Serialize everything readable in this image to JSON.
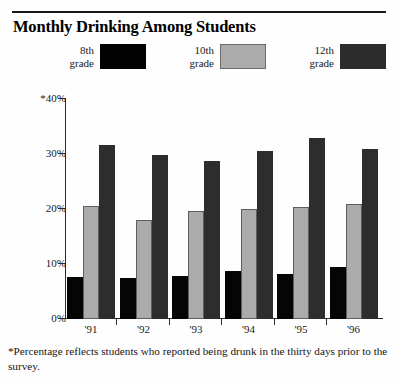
{
  "title": "Monthly Drinking Among Students",
  "footnote": "*Percentage reflects students who reported being drunk in the thirty days prior to the survey.",
  "legend": {
    "position": "top",
    "items": [
      {
        "line1": "8th",
        "line2": "grade",
        "color": "#050505",
        "series": "8th grade"
      },
      {
        "line1": "10th",
        "line2": "grade",
        "color": "#ababab",
        "series": "10th grade"
      },
      {
        "line1": "12th",
        "line2": "grade",
        "color": "#2d2d2d",
        "series": "12th grade"
      }
    ]
  },
  "yaxis": {
    "ticks": [
      "*40%",
      "30%",
      "20%",
      "10%",
      "0%"
    ]
  },
  "chart_data": {
    "type": "bar",
    "title": "Monthly Drinking Among Students",
    "xlabel": "",
    "ylabel": "",
    "ylim": [
      0,
      40
    ],
    "ytick_values": [
      0,
      10,
      20,
      30,
      40
    ],
    "ytick_labels": [
      "0%",
      "10%",
      "20%",
      "30%",
      "*40%"
    ],
    "grid": false,
    "legend_position": "top",
    "categories": [
      "'91",
      "'92",
      "'93",
      "'94",
      "'95",
      "'96"
    ],
    "series": [
      {
        "name": "8th grade",
        "color": "#050505",
        "values": [
          7.6,
          7.5,
          7.8,
          8.7,
          8.2,
          9.4
        ]
      },
      {
        "name": "10th grade",
        "color": "#ababab",
        "values": [
          20.5,
          18.0,
          19.6,
          20.0,
          20.4,
          21.0
        ]
      },
      {
        "name": "12th grade",
        "color": "#2d2d2d",
        "values": [
          31.6,
          29.8,
          28.7,
          30.6,
          33.0,
          31.0
        ]
      }
    ],
    "annotations": [
      "*Percentage reflects students who reported being drunk in the thirty days prior to the survey."
    ]
  }
}
